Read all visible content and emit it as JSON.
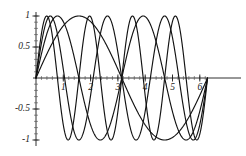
{
  "chart_data": {
    "type": "line",
    "title": "",
    "subtitle": "",
    "xlabel": "",
    "ylabel": "",
    "xlim": [
      0,
      6.2832
    ],
    "ylim": [
      -1,
      1
    ],
    "grid": false,
    "legend": "none",
    "x_ticks": [
      {
        "value": 1,
        "label": "1"
      },
      {
        "value": 2,
        "label": "2"
      },
      {
        "value": 3,
        "label": "3"
      },
      {
        "value": 4,
        "label": "4"
      },
      {
        "value": 5,
        "label": "5"
      },
      {
        "value": 6,
        "label": "6"
      }
    ],
    "y_ticks": [
      {
        "value": 1,
        "label": "1"
      },
      {
        "value": 0.5,
        "label": "0.5"
      },
      {
        "value": -0.5,
        "label": "-0.5"
      },
      {
        "value": -1,
        "label": "-1"
      }
    ],
    "x_minor_tick_step": 0.2,
    "y_minor_tick_step": 0.1,
    "series": [
      {
        "name": "sin(x)",
        "harmonic": 1,
        "amplitude": 1,
        "color": "#131313"
      },
      {
        "name": "sin(2x)",
        "harmonic": 2,
        "amplitude": 1,
        "color": "#131313"
      },
      {
        "name": "sin(3x)",
        "harmonic": 3,
        "amplitude": 1,
        "color": "#131313"
      },
      {
        "name": "sin(4x)",
        "harmonic": 4,
        "amplitude": 1,
        "color": "#131313"
      }
    ],
    "common_zeros": [
      0,
      3.1416,
      6.2832
    ]
  },
  "geometry": {
    "width": 246,
    "height": 156,
    "origin_x": 36,
    "origin_y": 78,
    "x_scale_px_per_unit": 27.3,
    "y_scale_px_per_unit": 62,
    "axis_x_start": 33,
    "axis_x_end": 241,
    "axis_y_top": 12,
    "axis_y_bottom": 146
  },
  "style": {
    "background": "#ffffff",
    "axis_color": "#1a1a1a",
    "curve_color": "#131313",
    "label_color": "#1a1a1a"
  }
}
